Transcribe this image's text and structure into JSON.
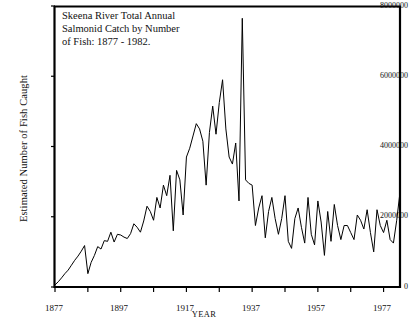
{
  "chart_data": {
    "type": "line",
    "title": "Skeena River Total Annual\nSalmonid Catch by Number\nof Fish:  1877 - 1982.",
    "xlabel": "YEAR",
    "ylabel": "Estimated Number of Fish Caught",
    "xlim": [
      1877,
      1982
    ],
    "ylim": [
      0,
      8000000
    ],
    "grid": false,
    "legend": null,
    "line_color": "#000000",
    "frame_color": "#000000",
    "background": "#ffffff",
    "ytick_labels": [
      "8000000",
      "6000000",
      "4000000",
      "2000000",
      "0"
    ],
    "ytick_values": [
      8000000,
      6000000,
      4000000,
      2000000,
      0
    ],
    "xtick_labels": [
      "1877",
      "1897",
      "1917",
      "1937",
      "1957",
      "1977"
    ],
    "xtick_values": [
      1877,
      1897,
      1917,
      1937,
      1957,
      1977
    ],
    "xminor_values": [
      1887,
      1907,
      1927,
      1947,
      1967
    ],
    "x": [
      1877,
      1878,
      1879,
      1880,
      1881,
      1882,
      1883,
      1884,
      1885,
      1886,
      1887,
      1888,
      1889,
      1890,
      1891,
      1892,
      1893,
      1894,
      1895,
      1896,
      1897,
      1898,
      1899,
      1900,
      1901,
      1902,
      1903,
      1904,
      1905,
      1906,
      1907,
      1908,
      1909,
      1910,
      1911,
      1912,
      1913,
      1914,
      1915,
      1916,
      1917,
      1918,
      1919,
      1920,
      1921,
      1922,
      1923,
      1924,
      1925,
      1926,
      1927,
      1928,
      1929,
      1930,
      1931,
      1932,
      1933,
      1934,
      1935,
      1936,
      1937,
      1938,
      1939,
      1940,
      1941,
      1942,
      1943,
      1944,
      1945,
      1946,
      1947,
      1948,
      1949,
      1950,
      1951,
      1952,
      1953,
      1954,
      1955,
      1956,
      1957,
      1958,
      1959,
      1960,
      1961,
      1962,
      1963,
      1964,
      1965,
      1966,
      1967,
      1968,
      1969,
      1970,
      1971,
      1972,
      1973,
      1974,
      1975,
      1976,
      1977,
      1978,
      1979,
      1980,
      1981,
      1982
    ],
    "values": [
      60000,
      150000,
      260000,
      380000,
      480000,
      620000,
      760000,
      880000,
      1020000,
      1180000,
      380000,
      700000,
      900000,
      1150000,
      1080000,
      1320000,
      1300000,
      1560000,
      1280000,
      1500000,
      1480000,
      1420000,
      1380000,
      1520000,
      1800000,
      1700000,
      1560000,
      1880000,
      2300000,
      2150000,
      1900000,
      2550000,
      2250000,
      2900000,
      2600000,
      3180000,
      1600000,
      3320000,
      3050000,
      2050000,
      3700000,
      3950000,
      4300000,
      4650000,
      4500000,
      4150000,
      2900000,
      4400000,
      5150000,
      4350000,
      5250000,
      5900000,
      4500000,
      3700000,
      3500000,
      4100000,
      2450000,
      7650000,
      3050000,
      2950000,
      2900000,
      1750000,
      2250000,
      2600000,
      1400000,
      2150000,
      2550000,
      1950000,
      1500000,
      1950000,
      2600000,
      1300000,
      1100000,
      1950000,
      2250000,
      1700000,
      1250000,
      2550000,
      1500000,
      1200000,
      2450000,
      1850000,
      900000,
      2150000,
      1300000,
      2350000,
      1750000,
      1350000,
      1750000,
      1750000,
      1550000,
      1350000,
      2050000,
      1900000,
      1650000,
      2200000,
      1550000,
      1000000,
      2200000,
      1750000,
      1550000,
      1900000,
      1350000,
      1250000,
      1900000,
      2700000
    ]
  }
}
